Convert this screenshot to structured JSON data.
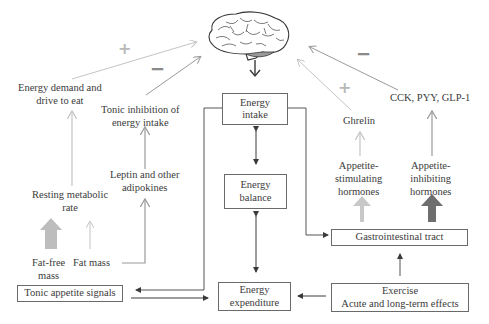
{
  "diagram": {
    "nodes": {
      "energy_intake": [
        "Energy",
        "intake"
      ],
      "energy_balance": [
        "Energy",
        "balance"
      ],
      "energy_expenditure": [
        "Energy",
        "expenditure"
      ],
      "gi_tract": "Gastrointestinal tract",
      "exercise": [
        "Exercise",
        "Acute and long-term effects"
      ],
      "tonic_appetite": "Tonic appetite signals",
      "energy_demand": [
        "Energy demand and",
        "drive to eat"
      ],
      "tonic_inhibition": [
        "Tonic inhibition of",
        "energy intake"
      ],
      "leptin": [
        "Leptin and other",
        "adipokines"
      ],
      "rmr": [
        "Resting metabolic",
        "rate"
      ],
      "fat_free_mass": [
        "Fat-free",
        "mass"
      ],
      "fat_mass": "Fat mass",
      "ghrelin": "Ghrelin",
      "cck": "CCK, PYY, GLP-1",
      "appetite_stimulating": [
        "Appetite-",
        "stimulating",
        "hormones"
      ],
      "appetite_inhibiting": [
        "Appetite-",
        "inhibiting",
        "hormones"
      ]
    },
    "signs": {
      "energy_demand": "+",
      "tonic_inhibition": "−",
      "ghrelin": "+",
      "cck": "−"
    },
    "colors": {
      "plus": "#b8b8b8",
      "minus": "#8a8a8a",
      "light_arrow": "#c4c4c4",
      "mid_arrow": "#9a9a9a",
      "dark_arrow": "#6e6e6e",
      "box_border": "#6a6a6a"
    }
  }
}
